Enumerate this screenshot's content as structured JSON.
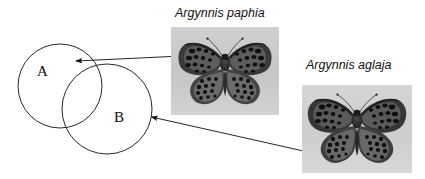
{
  "figure": {
    "type": "venn-diagram-with-specimen-photos",
    "background_color": "#ffffff"
  },
  "venn": {
    "circle_a": {
      "label": "A",
      "cx": 60,
      "cy": 86,
      "r": 42,
      "stroke": "#111111"
    },
    "circle_b": {
      "label": "B",
      "cx": 107,
      "cy": 109,
      "r": 45,
      "stroke": "#111111"
    }
  },
  "captions": {
    "paphia": "Argynnis paphia",
    "aglaja": "Argynnis aglaja"
  },
  "photos": [
    {
      "name": "argynnis-paphia-specimen",
      "species": "Argynnis paphia",
      "background_color": "#c9c9c9",
      "wing_color": "#3b3b3b",
      "spot_color": "#141414"
    },
    {
      "name": "argynnis-aglaja-specimen",
      "species": "Argynnis aglaja",
      "background_color": "#cfcfcf",
      "wing_color": "#3a3a3a",
      "spot_color": "#121212"
    }
  ],
  "arrows": [
    {
      "name": "arrow-paphia-to-a",
      "from_label": "Argynnis paphia",
      "to_label": "A",
      "tip_x": 72,
      "tip_y": 61,
      "tail_x": 171,
      "tail_y": 56
    },
    {
      "name": "arrow-aglaja-to-b",
      "from_label": "Argynnis aglaja",
      "to_label": "B",
      "tip_x": 147,
      "tip_y": 116,
      "tail_x": 308,
      "tail_y": 152
    }
  ]
}
